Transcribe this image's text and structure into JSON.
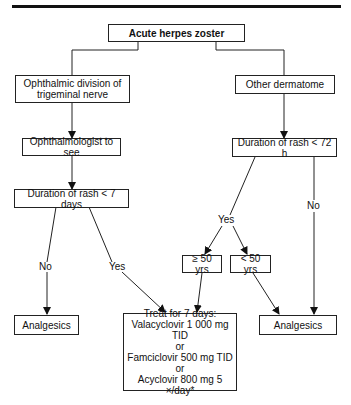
{
  "nodes": {
    "root": "Acute herpes zoster",
    "ophthalmic": [
      "Ophthalmic division of",
      "trigeminal nerve"
    ],
    "other": "Other dermatome",
    "ophthalmologist": "Ophthalmologist to see",
    "rash7": "Duration of rash < 7 days",
    "rash72": "Duration of rash < 72 h",
    "age_ge50": "≥ 50 yrs",
    "age_lt50": "< 50 yrs",
    "analgesics_left": "Analgesics",
    "analgesics_right": "Analgesics",
    "treat": [
      "Treat for 7 days:",
      "Valacyclovir 1 000 mg TID",
      "or",
      "Famciclovir 500 mg TID",
      "or",
      "Acyclovir 800 mg 5 ×/day*"
    ]
  },
  "edge_labels": {
    "rash7_no": "No",
    "rash7_yes": "Yes",
    "rash72_yes": "Yes",
    "rash72_no": "No"
  },
  "colors": {
    "line": "#222222",
    "rule": "#111111",
    "background": "#ffffff"
  }
}
